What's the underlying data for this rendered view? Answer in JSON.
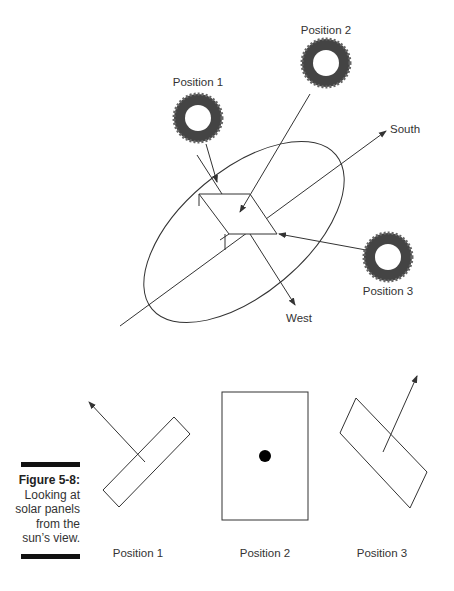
{
  "diagram": {
    "top": {
      "suns": [
        {
          "label": "Position 1",
          "icon": "sun-icon"
        },
        {
          "label": "Position 2",
          "icon": "sun-icon"
        },
        {
          "label": "Position 3",
          "icon": "sun-icon"
        }
      ],
      "axes": {
        "south_label": "South",
        "west_label": "West"
      }
    },
    "bottom": {
      "views": [
        {
          "label": "Position 1"
        },
        {
          "label": "Position 2"
        },
        {
          "label": "Position 3"
        }
      ]
    }
  },
  "caption": {
    "figure": "Figure 5-8:",
    "text": "Looking at solar panels from the sun's view.",
    "lines": [
      "Looking at",
      "solar panels",
      "from the",
      "sun’s view."
    ]
  }
}
